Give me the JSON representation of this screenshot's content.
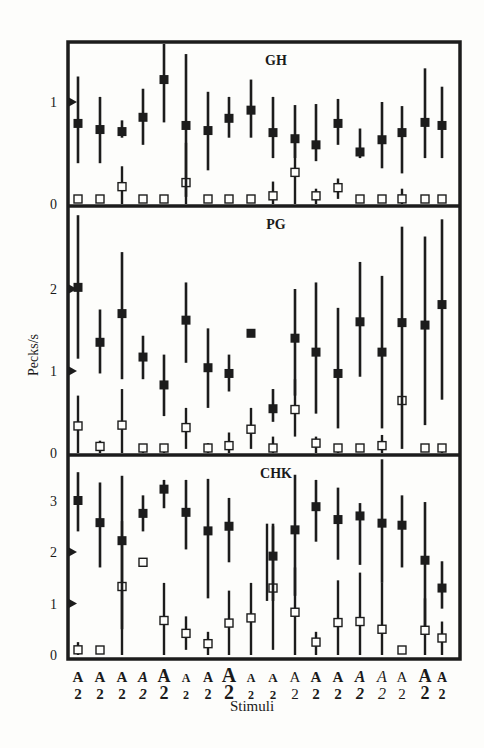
{
  "chart_data": {
    "type": "scatter",
    "subtype": "error-bar panels",
    "xlabel": "Stimuli",
    "ylabel": "Pecks/s",
    "stimuli": [
      {
        "top": "A",
        "bottom": "2",
        "style": "bold"
      },
      {
        "top": "A",
        "bottom": "2",
        "style": "bold-serif"
      },
      {
        "top": "A",
        "bottom": "2",
        "style": "bold"
      },
      {
        "top": "A",
        "bottom": "2",
        "style": "italic"
      },
      {
        "top": "A",
        "bottom": "2",
        "style": "black-large"
      },
      {
        "top": "A",
        "bottom": "2",
        "style": "black-small"
      },
      {
        "top": "A",
        "bottom": "2",
        "style": "rounded"
      },
      {
        "top": "A",
        "bottom": "2",
        "style": "wide-large"
      },
      {
        "top": "A",
        "bottom": "2",
        "style": "narrow"
      },
      {
        "top": "A",
        "bottom": "2",
        "style": "rounded-small"
      },
      {
        "top": "A",
        "bottom": "2",
        "style": "outline"
      },
      {
        "top": "A",
        "bottom": "2",
        "style": "block"
      },
      {
        "top": "A",
        "bottom": "2",
        "style": "bold"
      },
      {
        "top": "A",
        "bottom": "2",
        "style": "italic-bold"
      },
      {
        "top": "A",
        "bottom": "2",
        "style": "italic-light"
      },
      {
        "top": "A",
        "bottom": "2",
        "style": "light"
      },
      {
        "top": "A",
        "bottom": "2",
        "style": "black-large"
      },
      {
        "top": "A",
        "bottom": "2",
        "style": "bold-small"
      }
    ],
    "legend": [
      {
        "marker": "filled-square",
        "meaning": "A stimulus (positive)"
      },
      {
        "marker": "open-square",
        "meaning": "2 stimulus (negative)"
      }
    ],
    "panels": [
      {
        "name": "GH",
        "ylim": [
          0,
          1.6
        ],
        "yticks": [
          0,
          1
        ],
        "reference_markers": [
          1
        ],
        "filled": {
          "mean": [
            0.79,
            0.73,
            0.71,
            0.85,
            1.22,
            0.77,
            0.72,
            0.84,
            0.92,
            0.7,
            0.64,
            0.58,
            0.79,
            0.51,
            0.63,
            0.7,
            0.8,
            0.77
          ],
          "low": [
            0.4,
            0.4,
            0.65,
            0.58,
            0.8,
            0.07,
            0.33,
            0.65,
            0.65,
            0.45,
            0.45,
            0.42,
            0.58,
            0.45,
            0.35,
            0.3,
            0.45,
            0.45
          ],
          "high": [
            1.25,
            1.05,
            0.82,
            1.13,
            1.6,
            1.47,
            1.1,
            1.05,
            1.22,
            1.05,
            0.97,
            0.98,
            1.03,
            0.74,
            1.0,
            0.96,
            1.33,
            1.15
          ]
        },
        "open": {
          "mean": [
            0.02,
            0.02,
            0.17,
            0.02,
            0.02,
            0.21,
            0.02,
            0.02,
            0.02,
            0.08,
            0.31,
            0.08,
            0.16,
            0.02,
            0.02,
            0.05,
            0.02,
            0.02
          ],
          "low": [
            0.0,
            0.0,
            0.0,
            0.0,
            0.0,
            0.0,
            0.0,
            0.0,
            0.0,
            0.0,
            0.0,
            0.0,
            0.05,
            0.0,
            0.0,
            0.0,
            0.0,
            0.0
          ],
          "high": [
            0.02,
            0.02,
            0.37,
            0.02,
            0.02,
            0.6,
            0.02,
            0.02,
            0.02,
            0.22,
            0.6,
            0.15,
            0.25,
            0.02,
            0.02,
            0.15,
            0.02,
            0.02
          ]
        }
      },
      {
        "name": "PG",
        "ylim": [
          0,
          2.95
        ],
        "yticks": [
          0,
          1,
          2
        ],
        "reference_markers": [
          1,
          2
        ],
        "filled": {
          "mean": [
            2.02,
            1.35,
            1.7,
            1.17,
            0.83,
            1.62,
            1.04,
            0.97,
            1.46,
            0.54,
            1.4,
            1.23,
            0.97,
            1.6,
            1.23,
            1.59,
            1.56,
            1.81
          ],
          "low": [
            1.15,
            0.97,
            0.9,
            0.9,
            0.45,
            1.1,
            0.55,
            0.75,
            1.46,
            0.38,
            0.7,
            0.48,
            0.3,
            0.93,
            0.3,
            0.05,
            0.34,
            0.65
          ],
          "high": [
            2.9,
            1.75,
            2.45,
            1.43,
            1.2,
            2.08,
            1.52,
            1.2,
            1.46,
            0.78,
            2.0,
            2.08,
            1.77,
            2.33,
            2.16,
            2.76,
            2.64,
            2.85
          ]
        },
        "open": {
          "mean": [
            0.33,
            0.08,
            0.34,
            0.04,
            0.04,
            0.31,
            0.05,
            0.09,
            0.29,
            0.04,
            0.53,
            0.12,
            0.04,
            0.03,
            0.09,
            0.64,
            0.04,
            0.04
          ],
          "low": [
            0.0,
            0.0,
            0.0,
            0.0,
            0.0,
            0.05,
            0.0,
            0.0,
            0.05,
            0.0,
            0.2,
            0.0,
            0.0,
            0.0,
            0.0,
            0.64,
            0.0,
            0.0
          ],
          "high": [
            0.7,
            0.15,
            0.78,
            0.1,
            0.1,
            0.55,
            0.12,
            0.25,
            0.55,
            0.2,
            0.9,
            0.2,
            0.1,
            0.03,
            0.22,
            0.64,
            0.04,
            0.1
          ]
        }
      },
      {
        "name": "CHK",
        "ylim": [
          0,
          3.55
        ],
        "yticks": [
          0,
          1,
          2,
          3
        ],
        "reference_markers": [
          1,
          2
        ],
        "filled": {
          "mean": [
            3.0,
            2.57,
            2.22,
            2.75,
            3.22,
            2.77,
            2.41,
            2.5,
            null,
            1.92,
            2.43,
            2.88,
            2.63,
            2.7,
            2.56,
            2.52,
            1.84,
            1.3
          ],
          "low": [
            2.4,
            1.7,
            0.5,
            2.4,
            2.85,
            2.05,
            1.1,
            1.8,
            null,
            1.05,
            1.15,
            2.2,
            1.85,
            1.75,
            1.4,
            1.7,
            0.55,
            0.9
          ],
          "high": [
            3.55,
            3.35,
            3.48,
            3.1,
            3.4,
            3.4,
            3.42,
            3.05,
            null,
            2.55,
            3.5,
            3.4,
            3.25,
            2.95,
            3.8,
            3.1,
            2.97,
            1.82
          ],
          "extra_bars": [
            {
              "index": 9,
              "x_offset": -6,
              "low": 1.05,
              "high": 2.55
            }
          ]
        },
        "open": {
          "mean": [
            0.1,
            0.02,
            1.33,
            1.8,
            0.67,
            0.42,
            0.22,
            0.62,
            0.72,
            1.3,
            0.83,
            0.25,
            0.63,
            0.65,
            0.5,
            0.03,
            0.48,
            0.33
          ],
          "low": [
            0.0,
            0.0,
            0.0,
            1.8,
            0.0,
            0.1,
            0.0,
            0.0,
            0.0,
            0.1,
            0.0,
            0.0,
            0.0,
            0.0,
            0.0,
            0.03,
            0.0,
            0.0
          ],
          "high": [
            0.25,
            0.02,
            2.6,
            1.8,
            1.4,
            0.75,
            0.45,
            1.25,
            1.4,
            2.5,
            1.7,
            0.45,
            1.45,
            1.6,
            1.4,
            0.03,
            1.1,
            0.65
          ]
        }
      }
    ],
    "grid": false,
    "legend_position": "none"
  },
  "layout": {
    "frame": {
      "left": 68,
      "right": 460,
      "top": 42
    },
    "panel_zero_y": [
      204,
      453,
      655
    ],
    "panel_top_y": [
      42,
      206,
      455
    ],
    "panel_unit_px": [
      102,
      82,
      51.5
    ],
    "stimulus_x": [
      78,
      100,
      122,
      143,
      164,
      186,
      208,
      229,
      251,
      273,
      295,
      316,
      338,
      360,
      382,
      402,
      425,
      442
    ],
    "open_x_offset": 0
  }
}
